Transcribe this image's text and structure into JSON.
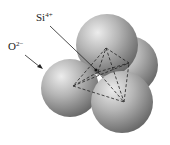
{
  "diagram": {
    "labels": {
      "silicon": {
        "base": "Si",
        "charge": "4+"
      },
      "oxygen": {
        "base": "O",
        "charge": "2−"
      }
    },
    "colors": {
      "sphere_light": "#e6e6e6",
      "sphere_mid": "#a8a8a8",
      "sphere_dark": "#6a6a6a",
      "lines": "#222222"
    }
  }
}
